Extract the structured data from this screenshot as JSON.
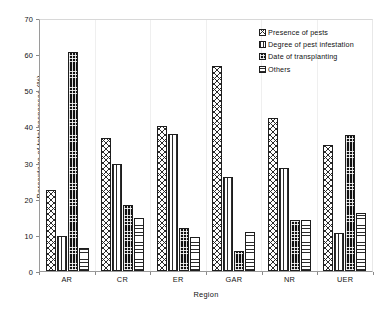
{
  "chart_data": {
    "type": "bar",
    "title": "",
    "xlabel": "Region",
    "ylabel": "Percentage of total responses (%)",
    "ylim": [
      0,
      70
    ],
    "yticks": [
      0,
      10,
      20,
      30,
      40,
      50,
      60,
      70
    ],
    "grid": false,
    "legend_position": "top-right",
    "categories": [
      "AR",
      "CR",
      "ER",
      "GAR",
      "NR",
      "UER"
    ],
    "series": [
      {
        "name": "Presence of pests",
        "pattern": "diagonal-crosshatch",
        "values": [
          22.5,
          37.0,
          40.5,
          57.3,
          42.6,
          35.2
        ]
      },
      {
        "name": "Degree of pest infestation",
        "pattern": "vertical-lines",
        "values": [
          9.7,
          29.8,
          38.2,
          26.2,
          28.8,
          10.7
        ]
      },
      {
        "name": "Date of transplanting",
        "pattern": "black-dotted",
        "values": [
          61.2,
          18.5,
          12.0,
          5.5,
          14.2,
          37.8
        ]
      },
      {
        "name": "Others",
        "pattern": "horizontal-lines",
        "values": [
          6.3,
          14.7,
          9.5,
          11.0,
          14.2,
          16.2
        ]
      }
    ]
  },
  "colors": {
    "axis": "#9a9a9a",
    "ink": "#1d1d1d",
    "background": "#ffffff"
  }
}
